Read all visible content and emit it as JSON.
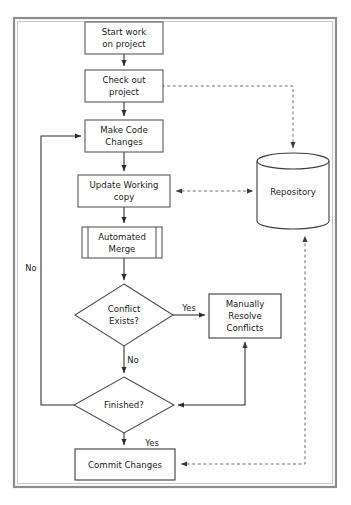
{
  "diagram": {
    "colors": {
      "background": "#ffffff",
      "frame": "#8c8c8c",
      "node_stroke": "#4a4a4a",
      "solid_edge": "#2b2b2b",
      "dashed_edge": "#6e6e6e",
      "text": "#1a1a1a"
    },
    "frame": {
      "x": 13,
      "y": 17,
      "width": 324,
      "height": 471
    },
    "nodes": [
      {
        "id": "start-work",
        "shape": "process",
        "lines": [
          "Start work",
          "on project"
        ],
        "x": 85,
        "y": 22,
        "width": 78,
        "height": 32
      },
      {
        "id": "check-out",
        "shape": "process",
        "lines": [
          "Check out",
          "project"
        ],
        "x": 85,
        "y": 70,
        "width": 78,
        "height": 32
      },
      {
        "id": "make-code-changes",
        "shape": "process",
        "lines": [
          "Make Code",
          "Changes"
        ],
        "x": 85,
        "y": 120,
        "width": 78,
        "height": 32
      },
      {
        "id": "update-working-copy",
        "shape": "process",
        "lines": [
          "Update Working",
          "copy"
        ],
        "x": 78,
        "y": 175,
        "width": 92,
        "height": 32
      },
      {
        "id": "automated-merge",
        "shape": "predefined-process",
        "lines": [
          "Automated",
          "Merge"
        ],
        "x": 82,
        "y": 227,
        "width": 80,
        "height": 31
      },
      {
        "id": "conflict-exists",
        "shape": "decision",
        "lines": [
          "Conflict",
          "Exists?"
        ],
        "cx": 124,
        "cy": 315,
        "rx": 49,
        "ry": 31
      },
      {
        "id": "manually-resolve",
        "shape": "process",
        "lines": [
          "Manually",
          "Resolve",
          "Conflicts"
        ],
        "x": 209,
        "y": 294,
        "width": 72,
        "height": 44
      },
      {
        "id": "finished",
        "shape": "decision",
        "lines": [
          "Finished?"
        ],
        "cx": 124,
        "cy": 405,
        "rx": 50,
        "ry": 28
      },
      {
        "id": "commit-changes",
        "shape": "process",
        "lines": [
          "Commit Changes"
        ],
        "x": 75,
        "y": 449,
        "width": 100,
        "height": 31
      },
      {
        "id": "repository",
        "shape": "cylinder",
        "lines": [
          "Repository"
        ],
        "cx": 293,
        "cy": 191,
        "rx": 36,
        "ry": 38,
        "cap": 8
      }
    ],
    "edges": [
      {
        "id": "start-to-checkout",
        "style": "solid",
        "label": ""
      },
      {
        "id": "checkout-to-makecode",
        "style": "solid",
        "label": ""
      },
      {
        "id": "makecode-to-update",
        "style": "solid",
        "label": ""
      },
      {
        "id": "update-to-merge",
        "style": "solid",
        "label": ""
      },
      {
        "id": "merge-to-conflict",
        "style": "solid",
        "label": ""
      },
      {
        "id": "conflict-yes-to-resolve",
        "style": "solid",
        "label": "Yes"
      },
      {
        "id": "conflict-no-to-finished",
        "style": "solid",
        "label": "No"
      },
      {
        "id": "resolve-down-to-finished",
        "style": "solid",
        "label": ""
      },
      {
        "id": "finished-no-to-makecode",
        "style": "solid",
        "label": "No"
      },
      {
        "id": "finished-yes-to-commit",
        "style": "solid",
        "label": "Yes"
      },
      {
        "id": "repository-to-checkout",
        "style": "dashed",
        "label": ""
      },
      {
        "id": "repository-to-update",
        "style": "dashed",
        "label": ""
      },
      {
        "id": "commit-to-repository",
        "style": "dashed",
        "label": ""
      }
    ],
    "edge_labels": {
      "conflict_yes": "Yes",
      "conflict_no": "No",
      "finished_no": "No",
      "finished_yes": "Yes"
    }
  }
}
